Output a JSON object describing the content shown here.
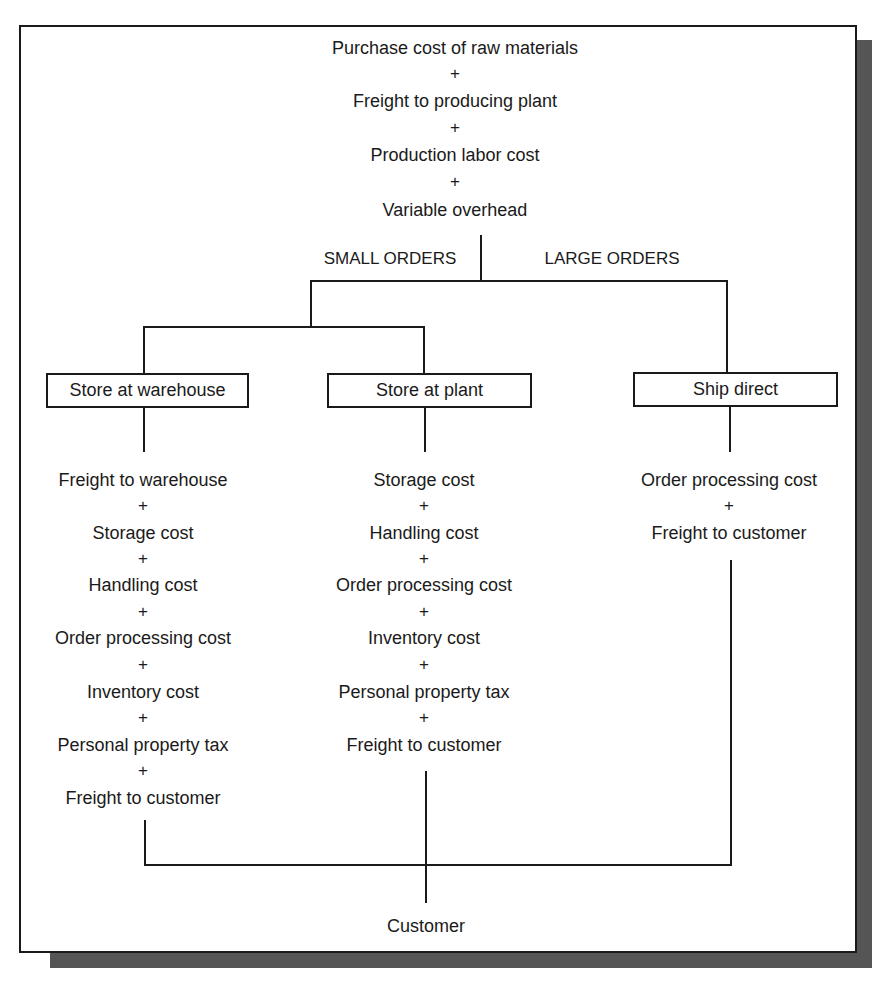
{
  "top_stack": {
    "items": [
      "Purchase cost of raw materials",
      "Freight to producing plant",
      "Production labor cost",
      "Variable overhead"
    ],
    "operator": "+"
  },
  "branch_labels": {
    "left": "SMALL ORDERS",
    "right": "LARGE ORDERS"
  },
  "boxes": {
    "warehouse": "Store at warehouse",
    "plant": "Store at plant",
    "direct": "Ship direct"
  },
  "columns": {
    "warehouse": [
      "Freight to warehouse",
      "Storage cost",
      "Handling cost",
      "Order processing cost",
      "Inventory cost",
      "Personal property tax",
      "Freight to customer"
    ],
    "plant": [
      "Storage cost",
      "Handling cost",
      "Order processing cost",
      "Inventory cost",
      "Personal property tax",
      "Freight to customer"
    ],
    "direct": [
      "Order processing cost",
      "Freight to customer"
    ]
  },
  "operator": "+",
  "terminal": "Customer",
  "colors": {
    "line": "#1a1a1a",
    "shadow": "#555555",
    "background": "#ffffff"
  }
}
